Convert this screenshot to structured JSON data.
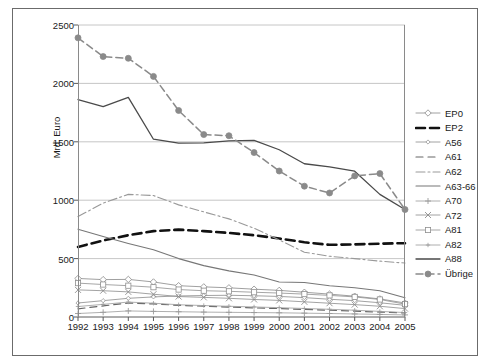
{
  "chart_data": {
    "type": "line",
    "title": "",
    "xlabel": "",
    "ylabel": "Mrd. Euro",
    "x": [
      1992,
      1993,
      1994,
      1995,
      1996,
      1997,
      1998,
      1999,
      2000,
      2001,
      2002,
      2003,
      2004,
      2005
    ],
    "categories": [
      "1992",
      "1993",
      "1994",
      "1995",
      "1996",
      "1997",
      "1998",
      "1999",
      "2000",
      "2001",
      "2002",
      "2003",
      "2004",
      "2005"
    ],
    "ylim": [
      0,
      2500
    ],
    "yticks": [
      0,
      500,
      1000,
      1500,
      2000,
      2500
    ],
    "ytick_labels": [
      "0",
      "500",
      "1000",
      "1500",
      "2000",
      "2500"
    ],
    "grid": "horizontal",
    "legend_position": "right",
    "series": [
      {
        "name": "EP0",
        "style": "solid-thin-marker",
        "marker": "diamond-open",
        "color": "#888888",
        "values": [
          330,
          320,
          322,
          300,
          268,
          258,
          250,
          238,
          228,
          212,
          196,
          178,
          155,
          120
        ]
      },
      {
        "name": "EP2",
        "style": "dashed-thick",
        "marker": "none",
        "color": "#111111",
        "values": [
          600,
          655,
          700,
          735,
          748,
          735,
          720,
          700,
          672,
          640,
          618,
          622,
          628,
          632
        ]
      },
      {
        "name": "A56",
        "style": "solid-thin-marker",
        "marker": "diamond-small",
        "color": "#8a8a8a",
        "values": [
          120,
          140,
          160,
          172,
          180,
          184,
          186,
          182,
          176,
          166,
          152,
          140,
          122,
          100
        ]
      },
      {
        "name": "A61",
        "style": "dashed-medium",
        "marker": "none",
        "color": "#666666",
        "values": [
          70,
          95,
          120,
          112,
          100,
          92,
          85,
          78,
          72,
          65,
          58,
          50,
          42,
          35
        ]
      },
      {
        "name": "A62",
        "style": "dash-dot",
        "marker": "none",
        "color": "#999999",
        "values": [
          860,
          975,
          1050,
          1040,
          960,
          900,
          840,
          760,
          660,
          555,
          520,
          500,
          478,
          462
        ]
      },
      {
        "name": "A63-66",
        "style": "solid-medium",
        "marker": "none",
        "color": "#777777",
        "values": [
          752,
          690,
          630,
          575,
          500,
          440,
          395,
          360,
          300,
          295,
          268,
          250,
          225,
          165
        ]
      },
      {
        "name": "A70",
        "style": "solid-plus",
        "marker": "plus",
        "color": "#9a9a9a",
        "values": [
          30,
          40,
          52,
          48,
          45,
          42,
          40,
          38,
          36,
          33,
          30,
          26,
          22,
          18
        ]
      },
      {
        "name": "A72",
        "style": "solid-x",
        "marker": "x",
        "color": "#8c8c8c",
        "values": [
          232,
          225,
          215,
          195,
          175,
          168,
          160,
          150,
          142,
          130,
          118,
          106,
          92,
          72
        ]
      },
      {
        "name": "A81",
        "style": "solid-square",
        "marker": "square-open",
        "color": "#8f8f8f",
        "values": [
          290,
          278,
          268,
          255,
          235,
          225,
          220,
          212,
          205,
          196,
          185,
          172,
          150,
          110
        ]
      },
      {
        "name": "A82",
        "style": "solid-plus2",
        "marker": "plus-small",
        "color": "#9a9a9a",
        "values": [
          90,
          108,
          128,
          118,
          105,
          98,
          92,
          86,
          80,
          73,
          66,
          58,
          48,
          38
        ]
      },
      {
        "name": "A88",
        "style": "solid-thick",
        "marker": "none",
        "color": "#4a4a4a",
        "values": [
          1862,
          1802,
          1880,
          1522,
          1488,
          1490,
          1508,
          1512,
          1432,
          1312,
          1285,
          1248,
          1050,
          920
        ]
      },
      {
        "name": "Übrige",
        "style": "dashed-marker",
        "marker": "circle-filled",
        "color": "#8a8a8a",
        "values": [
          2390,
          2230,
          2215,
          2060,
          1768,
          1562,
          1552,
          1408,
          1250,
          1120,
          1062,
          1208,
          1228,
          920
        ]
      }
    ]
  },
  "legend": {
    "items": [
      {
        "label": "EP0"
      },
      {
        "label": "EP2"
      },
      {
        "label": "A56"
      },
      {
        "label": "A61"
      },
      {
        "label": "A62"
      },
      {
        "label": "A63-66"
      },
      {
        "label": "A70"
      },
      {
        "label": "A72"
      },
      {
        "label": "A81"
      },
      {
        "label": "A82"
      },
      {
        "label": "A88"
      },
      {
        "label": "Übrige"
      }
    ]
  },
  "colors": {
    "frame": "#6b6b6b",
    "axis": "#8a8a8a",
    "grid": "#b8b8b8",
    "text": "#1a1a1a",
    "accent": "#4a4a4a"
  }
}
